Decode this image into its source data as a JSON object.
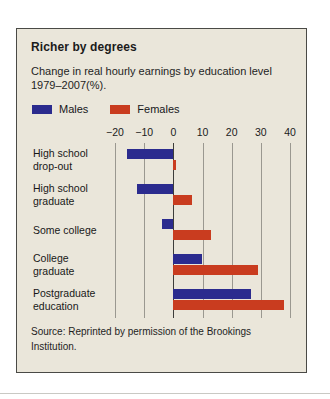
{
  "panel": {
    "title": "Richer by degrees",
    "subtitle": "Change in real hourly earnings by education level 1979–2007(%).",
    "source": "Source: Reprinted by permission of the Brookings Institution.",
    "background_color": "#eae6da",
    "border_color": "#4a4a46"
  },
  "legend": {
    "items": [
      {
        "label": "Males",
        "color": "#2b2b8e"
      },
      {
        "label": "Females",
        "color": "#c93c1f"
      }
    ]
  },
  "chart_data": {
    "type": "bar",
    "orientation": "horizontal",
    "title": "Richer by degrees",
    "subtitle": "Change in real hourly earnings by education level 1979–2007(%).",
    "xlabel": "",
    "ylabel": "",
    "xlim": [
      -20,
      40
    ],
    "xticks": [
      -20,
      -10,
      0,
      10,
      20,
      30,
      40
    ],
    "xtick_labels": [
      "−20",
      "−10",
      "0",
      "10",
      "20",
      "30",
      "40"
    ],
    "grid": true,
    "legend_position": "top-left",
    "categories": [
      "High school drop-out",
      "High school graduate",
      "Some college",
      "College graduate",
      "Postgraduate education"
    ],
    "series": [
      {
        "name": "Males",
        "color": "#2b2b8e",
        "values": [
          -16,
          -12.5,
          -4,
          10,
          26.5
        ]
      },
      {
        "name": "Females",
        "color": "#c93c1f",
        "values": [
          1,
          6.5,
          13,
          29,
          38
        ]
      }
    ]
  }
}
